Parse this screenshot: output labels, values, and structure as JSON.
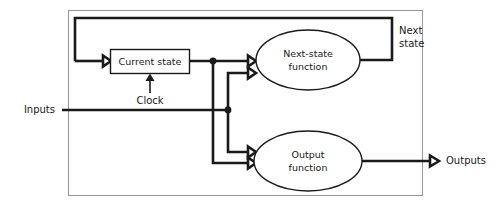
{
  "diagram": {
    "canvas": {
      "width": 504,
      "height": 212
    },
    "colors": {
      "line": "#1a1a1a",
      "frame": "#9a9a9a",
      "background": "#ffffff",
      "shape_fill": "#ffffff"
    },
    "blocks": {
      "current_state": {
        "label": "Current state",
        "shape": "rectangle"
      },
      "next_state_function": {
        "label_line1": "Next-state",
        "label_line2": "function",
        "shape": "ellipse"
      },
      "output_function": {
        "label_line1": "Output",
        "label_line2": "function",
        "shape": "ellipse"
      }
    },
    "labels": {
      "inputs": "Inputs",
      "outputs": "Outputs",
      "clock": "Clock",
      "next_state_line1": "Next",
      "next_state_line2": "state"
    },
    "signals": [
      {
        "name": "inputs",
        "from": "external",
        "to": "next-state function and output function"
      },
      {
        "name": "current-state",
        "from": "current state register",
        "to": "next-state function and output function"
      },
      {
        "name": "next-state",
        "from": "next-state function",
        "to": "current state register"
      },
      {
        "name": "clock",
        "from": "external",
        "to": "current state register"
      },
      {
        "name": "outputs",
        "from": "output function",
        "to": "external"
      }
    ]
  }
}
